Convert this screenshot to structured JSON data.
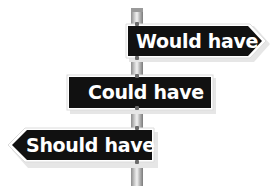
{
  "signs": [
    {
      "text": "Would have",
      "direction": "right"
    },
    {
      "text": "Could have",
      "direction": "none"
    },
    {
      "text": "Should have",
      "direction": "left"
    }
  ],
  "colors": {
    "sign_background": "#111111",
    "sign_text": "#ffffff",
    "sign_border": "#ffffff",
    "pole": "#c8c8c8"
  }
}
